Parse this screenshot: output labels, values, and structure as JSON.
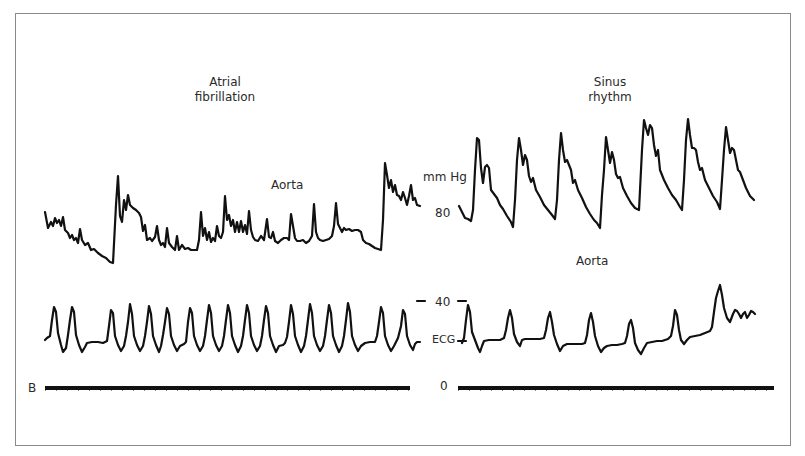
{
  "figure": {
    "panel_label": "B",
    "left_panel": {
      "title_line1": "Atrial",
      "title_line2": "fibrillation",
      "pressure_trace_label": "Aorta"
    },
    "right_panel": {
      "title_line1": "Sinus",
      "title_line2": "rhythm",
      "pressure_trace_label": "Aorta"
    },
    "center_scale": {
      "unit": "mm Hg",
      "tick_80": "80",
      "tick_40": "40",
      "ecg_label": "ECG",
      "tick_0": "0"
    },
    "colors": {
      "trace": "#111111",
      "frame": "#8a8a8a",
      "text": "#2a2a2a",
      "background": "#ffffff"
    }
  }
}
